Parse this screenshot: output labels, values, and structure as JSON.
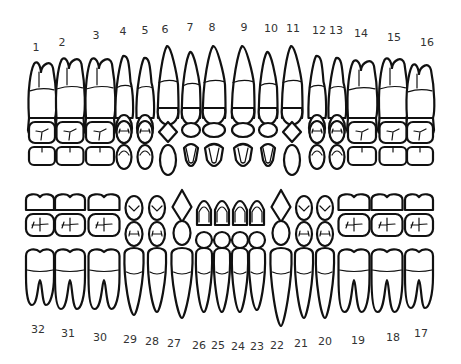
{
  "colors": {
    "outline": "#111111",
    "label": "#333333",
    "background": "#ffffff"
  },
  "upper_arch": {
    "labels": [
      {
        "n": "1",
        "x": 36,
        "y": 47
      },
      {
        "n": "2",
        "x": 62,
        "y": 42
      },
      {
        "n": "3",
        "x": 96,
        "y": 35
      },
      {
        "n": "4",
        "x": 123,
        "y": 31
      },
      {
        "n": "5",
        "x": 145,
        "y": 30
      },
      {
        "n": "6",
        "x": 165,
        "y": 29
      },
      {
        "n": "7",
        "x": 190,
        "y": 27
      },
      {
        "n": "8",
        "x": 212,
        "y": 27
      },
      {
        "n": "9",
        "x": 244,
        "y": 27
      },
      {
        "n": "10",
        "x": 271,
        "y": 28
      },
      {
        "n": "11",
        "x": 293,
        "y": 28
      },
      {
        "n": "12",
        "x": 319,
        "y": 30
      },
      {
        "n": "13",
        "x": 336,
        "y": 30
      },
      {
        "n": "14",
        "x": 361,
        "y": 33
      },
      {
        "n": "15",
        "x": 394,
        "y": 37
      },
      {
        "n": "16",
        "x": 427,
        "y": 42
      }
    ]
  },
  "lower_arch": {
    "labels": [
      {
        "n": "32",
        "x": 38,
        "y": 329
      },
      {
        "n": "31",
        "x": 68,
        "y": 333
      },
      {
        "n": "30",
        "x": 100,
        "y": 337
      },
      {
        "n": "29",
        "x": 130,
        "y": 339
      },
      {
        "n": "28",
        "x": 152,
        "y": 341
      },
      {
        "n": "27",
        "x": 174,
        "y": 343
      },
      {
        "n": "26",
        "x": 199,
        "y": 345
      },
      {
        "n": "25",
        "x": 218,
        "y": 345
      },
      {
        "n": "24",
        "x": 238,
        "y": 346
      },
      {
        "n": "23",
        "x": 257,
        "y": 346
      },
      {
        "n": "22",
        "x": 277,
        "y": 345
      },
      {
        "n": "21",
        "x": 301,
        "y": 343
      },
      {
        "n": "20",
        "x": 325,
        "y": 341
      },
      {
        "n": "19",
        "x": 358,
        "y": 340
      },
      {
        "n": "18",
        "x": 393,
        "y": 337
      },
      {
        "n": "17",
        "x": 421,
        "y": 333
      }
    ]
  },
  "upper_teeth": [
    {
      "n": 1,
      "type": "molar",
      "cx": 42,
      "w": 26,
      "top": 62
    },
    {
      "n": 2,
      "type": "molar",
      "cx": 70,
      "w": 27,
      "top": 58
    },
    {
      "n": 3,
      "type": "molar",
      "cx": 100,
      "w": 28,
      "top": 58
    },
    {
      "n": 4,
      "type": "premolar",
      "cx": 124,
      "w": 17,
      "top": 56
    },
    {
      "n": 5,
      "type": "premolar",
      "cx": 145,
      "w": 17,
      "top": 58
    },
    {
      "n": 6,
      "type": "canine",
      "cx": 168,
      "w": 20,
      "top": 46
    },
    {
      "n": 7,
      "type": "incisor",
      "cx": 191,
      "w": 18,
      "top": 52
    },
    {
      "n": 8,
      "type": "incisor",
      "cx": 214,
      "w": 22,
      "top": 46
    },
    {
      "n": 9,
      "type": "incisor",
      "cx": 243,
      "w": 22,
      "top": 46
    },
    {
      "n": 10,
      "type": "incisor",
      "cx": 268,
      "w": 18,
      "top": 52
    },
    {
      "n": 11,
      "type": "canine",
      "cx": 292,
      "w": 20,
      "top": 46
    },
    {
      "n": 12,
      "type": "premolar",
      "cx": 317,
      "w": 17,
      "top": 56
    },
    {
      "n": 13,
      "type": "premolar",
      "cx": 337,
      "w": 17,
      "top": 58
    },
    {
      "n": 14,
      "type": "molar",
      "cx": 362,
      "w": 28,
      "top": 60
    },
    {
      "n": 15,
      "type": "molar",
      "cx": 393,
      "w": 27,
      "top": 58
    },
    {
      "n": 16,
      "type": "molar",
      "cx": 420,
      "w": 26,
      "top": 64
    }
  ],
  "lower_teeth": [
    {
      "n": 32,
      "type": "molar",
      "cx": 40,
      "w": 28,
      "bottom": 305
    },
    {
      "n": 31,
      "type": "molar",
      "cx": 70,
      "w": 30,
      "bottom": 309
    },
    {
      "n": 30,
      "type": "molar",
      "cx": 104,
      "w": 31,
      "bottom": 309
    },
    {
      "n": 29,
      "type": "premolar",
      "cx": 134,
      "w": 19,
      "bottom": 315
    },
    {
      "n": 28,
      "type": "premolar",
      "cx": 157,
      "w": 18,
      "bottom": 312
    },
    {
      "n": 27,
      "type": "canine",
      "cx": 182,
      "w": 21,
      "bottom": 318
    },
    {
      "n": 26,
      "type": "incisor",
      "cx": 204,
      "w": 16,
      "bottom": 312
    },
    {
      "n": 25,
      "type": "incisor",
      "cx": 222,
      "w": 16,
      "bottom": 312
    },
    {
      "n": 24,
      "type": "incisor",
      "cx": 240,
      "w": 16,
      "bottom": 312
    },
    {
      "n": 23,
      "type": "incisor",
      "cx": 257,
      "w": 16,
      "bottom": 310
    },
    {
      "n": 22,
      "type": "canine",
      "cx": 281,
      "w": 21,
      "bottom": 326
    },
    {
      "n": 21,
      "type": "premolar",
      "cx": 304,
      "w": 18,
      "bottom": 318
    },
    {
      "n": 20,
      "type": "premolar",
      "cx": 325,
      "w": 18,
      "bottom": 318
    },
    {
      "n": 19,
      "type": "molar",
      "cx": 354,
      "w": 31,
      "bottom": 312
    },
    {
      "n": 18,
      "type": "molar",
      "cx": 387,
      "w": 31,
      "bottom": 312
    },
    {
      "n": 17,
      "type": "molar",
      "cx": 419,
      "w": 28,
      "bottom": 308
    }
  ]
}
